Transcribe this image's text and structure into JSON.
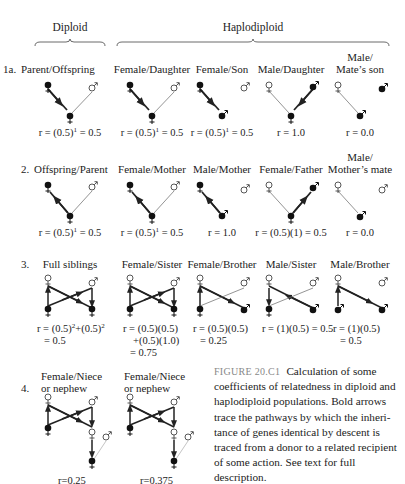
{
  "headers": {
    "diploid": "Diploid",
    "haplodiploid": "Haplodiploid"
  },
  "rows": [
    {
      "number": "1a.",
      "panels": [
        {
          "label": "Parent/Offspring",
          "formula": "r = (0.5)",
          "sup": "1",
          "result": " = 0.5"
        },
        {
          "label": "Female/Daughter",
          "formula": "r = (0.5)",
          "sup": "1",
          "result": " = 0.5"
        },
        {
          "label": "Female/Son",
          "formula": "r = (0.5)",
          "sup": "1",
          "result": " = 0.5"
        },
        {
          "label": "Male/Daughter",
          "formula": "r = 1.0"
        },
        {
          "label_line1": "Male/",
          "label_line2": "Mate’s son",
          "formula": "r = 0.0"
        }
      ]
    },
    {
      "number": "2.",
      "panels": [
        {
          "label": "Offspring/Parent",
          "formula": "r = (0.5)",
          "sup": "1",
          "result": " = 0.5"
        },
        {
          "label": "Female/Mother",
          "formula": "r = (0.5)",
          "sup": "1",
          "result": " = 0.5"
        },
        {
          "label": "Male/Mother",
          "formula": "r = 1.0"
        },
        {
          "label": "Female/Father",
          "formula": "r = (0.5)(1) =  0.5"
        },
        {
          "label_line1": "Male/",
          "label_line2": "Mother’s mate",
          "formula": "r = 0.0"
        }
      ]
    },
    {
      "number": "3.",
      "panels": [
        {
          "label": "Full siblings",
          "formula_line1": "r = (0.5)",
          "sup1": "2",
          "mid": "+(0.5)",
          "sup2": "2",
          "formula_line2": "= 0.5"
        },
        {
          "label": "Female/Sister",
          "formula_line1": "r = (0.5)(0.5)",
          "formula_line2": "+(0.5)(1.0)",
          "formula_line3": "= 0.75"
        },
        {
          "label": "Female/Brother",
          "formula_line1": "r = (0.5)(0.5)",
          "formula_line2": "= 0.25"
        },
        {
          "label": "Male/Sister",
          "formula_line1": "r = (1)(0.5) = 0.5"
        },
        {
          "label": "Male/Brother",
          "formula_line1": "r = (1)(0.5)",
          "formula_line2": "= 0.5"
        }
      ]
    },
    {
      "number": "4.",
      "panels": [
        {
          "label_line1": "Female/Niece",
          "label_line2": "or nephew",
          "formula": "r=0.25"
        },
        {
          "label_line1": "Female/Niece",
          "label_line2": "or nephew",
          "formula": "r=0.375"
        }
      ]
    }
  ],
  "symbols": {
    "female": "♀",
    "male": "♂"
  },
  "caption": {
    "label": "FIGURE 20.C1",
    "text": "Calculation of some coefficients of relatedness in diploid and haplodiploid populations. Bold arrows trace the pathways by which the inheri­tance of genes identical by descent is traced from a donor to a related recipi­ent of some action. See text for full description."
  },
  "colors": {
    "text": "#222222",
    "caption_label": "#888888",
    "line": "#222222",
    "thin_line": "#555555"
  }
}
